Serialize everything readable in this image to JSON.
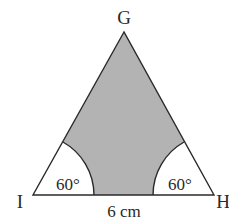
{
  "diagram": {
    "type": "geometry",
    "shape": "equilateral-triangle-with-sectors",
    "vertices": {
      "apex": {
        "label": "G",
        "x": 124,
        "y": 32
      },
      "left": {
        "label": "I",
        "x": 33,
        "y": 195
      },
      "right": {
        "label": "H",
        "x": 214,
        "y": 195
      }
    },
    "base_length_label": "6 cm",
    "angle_labels": {
      "left": "60°",
      "right": "60°"
    },
    "sector_radius_px": 61,
    "colors": {
      "shaded": "#b3b3b3",
      "stroke": "#2a2a2a",
      "unshaded": "#ffffff"
    }
  }
}
